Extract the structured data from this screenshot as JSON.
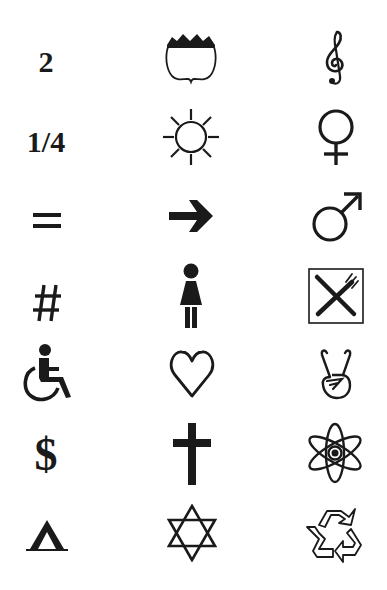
{
  "grid": {
    "columns": 3,
    "rows": 7,
    "items": [
      {
        "row": 1,
        "col": 1,
        "type": "text",
        "label": "2",
        "icon": "digit-two"
      },
      {
        "row": 1,
        "col": 2,
        "type": "icon",
        "icon": "us-highway-shield-icon"
      },
      {
        "row": 1,
        "col": 3,
        "type": "icon",
        "icon": "treble-clef-icon"
      },
      {
        "row": 2,
        "col": 1,
        "type": "text",
        "label": "1/4",
        "icon": "one-quarter-fraction"
      },
      {
        "row": 2,
        "col": 2,
        "type": "icon",
        "icon": "sun-icon"
      },
      {
        "row": 2,
        "col": 3,
        "type": "icon",
        "icon": "female-symbol-icon"
      },
      {
        "row": 3,
        "col": 1,
        "type": "text",
        "label": "=",
        "icon": "equals-sign"
      },
      {
        "row": 3,
        "col": 2,
        "type": "icon",
        "icon": "right-arrow-icon"
      },
      {
        "row": 3,
        "col": 3,
        "type": "icon",
        "icon": "male-symbol-icon"
      },
      {
        "row": 4,
        "col": 1,
        "type": "text",
        "label": "#",
        "icon": "hash-sign"
      },
      {
        "row": 4,
        "col": 2,
        "type": "icon",
        "icon": "woman-restroom-icon"
      },
      {
        "row": 4,
        "col": 3,
        "type": "icon",
        "icon": "restaurant-knife-fork-icon"
      },
      {
        "row": 5,
        "col": 1,
        "type": "icon",
        "icon": "wheelchair-accessible-icon"
      },
      {
        "row": 5,
        "col": 2,
        "type": "icon",
        "icon": "heart-outline-icon"
      },
      {
        "row": 5,
        "col": 3,
        "type": "icon",
        "icon": "peace-hand-icon"
      },
      {
        "row": 6,
        "col": 1,
        "type": "text",
        "label": "$",
        "icon": "dollar-sign"
      },
      {
        "row": 6,
        "col": 2,
        "type": "icon",
        "icon": "cross-icon"
      },
      {
        "row": 6,
        "col": 3,
        "type": "icon",
        "icon": "atom-icon"
      },
      {
        "row": 7,
        "col": 1,
        "type": "icon",
        "icon": "tent-campground-icon"
      },
      {
        "row": 7,
        "col": 2,
        "type": "icon",
        "icon": "star-of-david-icon"
      },
      {
        "row": 7,
        "col": 3,
        "type": "icon",
        "icon": "recycle-icon"
      }
    ]
  },
  "labels": {
    "two": "2",
    "quarter": "1/4",
    "equals": "=",
    "hash": "#",
    "dollar": "$"
  },
  "colors": {
    "ink": "#1a1a1a",
    "background": "#ffffff"
  }
}
